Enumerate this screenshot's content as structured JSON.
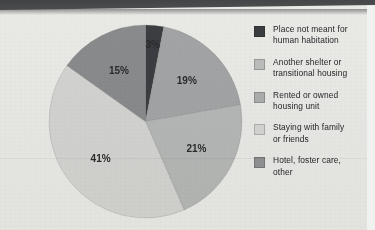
{
  "page": {
    "background_color": "#f3f3f1",
    "top_band_color": "#3f4143"
  },
  "chart_data": {
    "type": "pie",
    "title": "",
    "subtitle": "",
    "xlabel": "",
    "ylabel": "",
    "legend_position": "right",
    "grid": false,
    "categories": [
      "Place not meant for human habitation",
      "Another shelter or transitional housing",
      "Rented or owned housing unit",
      "Staying with family or friends",
      "Hotel, foster care, other"
    ],
    "values": [
      3,
      19,
      21,
      41,
      15
    ],
    "value_labels": [
      "3%",
      "19%",
      "21%",
      "41%",
      "15%"
    ],
    "colors": [
      "#3d4044",
      "#a9abad",
      "#bdbfbf",
      "#dcdddb",
      "#8e9093"
    ],
    "slices": [
      {
        "label": "3%",
        "value": 3,
        "category": "Place not meant for human habitation",
        "color": "#3d4044",
        "label_color": "#e9e9e7"
      },
      {
        "label": "19%",
        "value": 19,
        "category": "Another shelter or transitional housing",
        "color": "#a9abad",
        "label_color": "#2b2d2f"
      },
      {
        "label": "21%",
        "value": 21,
        "category": "Rented or owned housing unit",
        "color": "#bdbfbf",
        "label_color": "#2b2d2f"
      },
      {
        "label": "41%",
        "value": 41,
        "category": "Staying with family or friends",
        "color": "#dcdddb",
        "label_color": "#2b2d2f"
      },
      {
        "label": "15%",
        "value": 15,
        "category": "Hotel, foster care, other",
        "color": "#8e9093",
        "label_color": "#2b2d2f"
      }
    ]
  },
  "legend": {
    "items": [
      {
        "line1": "Place not meant for",
        "line2": "human habitation",
        "color": "#3d4044"
      },
      {
        "line1": "Another shelter or",
        "line2": "transitional housing",
        "color": "#c3c5c5"
      },
      {
        "line1": "Rented or owned",
        "line2": "housing unit",
        "color": "#b3b5b6"
      },
      {
        "line1": "Staying with family",
        "line2": "or friends",
        "color": "#dedfdd"
      },
      {
        "line1": "Hotel, foster care,",
        "line2": "other",
        "color": "#96989a"
      }
    ]
  }
}
